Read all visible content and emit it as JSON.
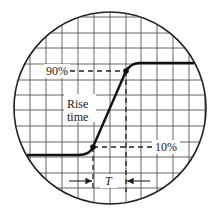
{
  "diagram": {
    "screen": {
      "cx": 110,
      "cy": 108,
      "r": 96
    },
    "grid": {
      "vertical_x": [
        14,
        30,
        46,
        62,
        78,
        94,
        110,
        126,
        141,
        157,
        173,
        189,
        205
      ],
      "horizontal_y": [
        17,
        33,
        48,
        64,
        80,
        95,
        110,
        126,
        142,
        157,
        173,
        188,
        204
      ]
    },
    "labels": {
      "upper_level": "90%",
      "lower_level": "10%",
      "rise_time_line1": "Rise",
      "rise_time_line2": "time",
      "period": "T"
    },
    "waveform": {
      "low_level_y": 155,
      "high_level_y": 63,
      "point_10": {
        "x": 93,
        "y": 147
      },
      "point_90": {
        "x": 126,
        "y": 71
      }
    },
    "colors": {
      "grid": "#444444",
      "trace": "#111111",
      "background": "#ffffff"
    }
  }
}
